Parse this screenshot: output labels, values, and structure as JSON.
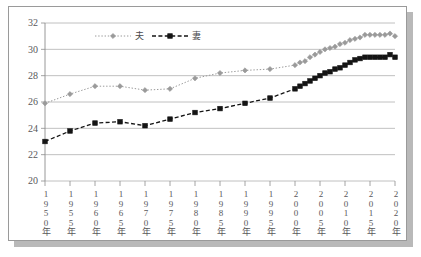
{
  "chart_data": {
    "type": "line",
    "title": "",
    "xlabel": "",
    "ylabel": "",
    "ylim": [
      20,
      32
    ],
    "yticks": [
      20,
      22,
      24,
      26,
      28,
      30,
      32
    ],
    "grid": true,
    "legend_position": "top-center-inside",
    "xlim": [
      1950,
      2020
    ],
    "xtick_labels": [
      "1950年",
      "1955年",
      "1960年",
      "1965年",
      "1970年",
      "1975年",
      "1980年",
      "1985年",
      "1990年",
      "1995年",
      "2000年",
      "2005年",
      "2010年",
      "2015年",
      "2020年"
    ],
    "x": [
      1950,
      1955,
      1960,
      1965,
      1970,
      1975,
      1980,
      1985,
      1990,
      1995,
      2000,
      2001,
      2002,
      2003,
      2004,
      2005,
      2006,
      2007,
      2008,
      2009,
      2010,
      2011,
      2012,
      2013,
      2014,
      2015,
      2016,
      2017,
      2018,
      2019,
      2020
    ],
    "series": [
      {
        "name": "夫",
        "color": "#9a9a9a",
        "linestyle": "dotted",
        "marker": "diamond",
        "values": [
          25.9,
          26.6,
          27.2,
          27.2,
          26.9,
          27.0,
          27.8,
          28.2,
          28.4,
          28.5,
          28.8,
          29.0,
          29.1,
          29.4,
          29.6,
          29.8,
          30.0,
          30.1,
          30.2,
          30.4,
          30.5,
          30.7,
          30.8,
          30.9,
          31.1,
          31.1,
          31.1,
          31.1,
          31.1,
          31.2,
          31.0
        ]
      },
      {
        "name": "妻",
        "color": "#141414",
        "linestyle": "dashed",
        "marker": "square",
        "values": [
          23.0,
          23.8,
          24.4,
          24.5,
          24.2,
          24.7,
          25.2,
          25.5,
          25.9,
          26.3,
          27.0,
          27.2,
          27.4,
          27.6,
          27.8,
          28.0,
          28.2,
          28.3,
          28.5,
          28.6,
          28.8,
          29.0,
          29.2,
          29.3,
          29.4,
          29.4,
          29.4,
          29.4,
          29.4,
          29.6,
          29.4
        ]
      }
    ],
    "legend": [
      {
        "label": "夫",
        "color": "#9a9a9a",
        "marker": "diamond",
        "linestyle": "dotted"
      },
      {
        "label": "妻",
        "color": "#141414",
        "marker": "square",
        "linestyle": "dashed"
      }
    ]
  },
  "axis": {
    "ytick_labels": [
      "32",
      "30",
      "28",
      "26",
      "24",
      "22",
      "20"
    ]
  },
  "xticks": [
    {
      "digits": [
        "1",
        "9",
        "5",
        "0"
      ],
      "unit": "年"
    },
    {
      "digits": [
        "1",
        "9",
        "5",
        "5"
      ],
      "unit": "年"
    },
    {
      "digits": [
        "1",
        "9",
        "6",
        "0"
      ],
      "unit": "年"
    },
    {
      "digits": [
        "1",
        "9",
        "6",
        "5"
      ],
      "unit": "年"
    },
    {
      "digits": [
        "1",
        "9",
        "7",
        "0"
      ],
      "unit": "年"
    },
    {
      "digits": [
        "1",
        "9",
        "7",
        "5"
      ],
      "unit": "年"
    },
    {
      "digits": [
        "1",
        "9",
        "8",
        "0"
      ],
      "unit": "年"
    },
    {
      "digits": [
        "1",
        "9",
        "8",
        "5"
      ],
      "unit": "年"
    },
    {
      "digits": [
        "1",
        "9",
        "9",
        "0"
      ],
      "unit": "年"
    },
    {
      "digits": [
        "1",
        "9",
        "9",
        "5"
      ],
      "unit": "年"
    },
    {
      "digits": [
        "2",
        "0",
        "0",
        "0"
      ],
      "unit": "年"
    },
    {
      "digits": [
        "2",
        "0",
        "0",
        "5"
      ],
      "unit": "年"
    },
    {
      "digits": [
        "2",
        "0",
        "1",
        "0"
      ],
      "unit": "年"
    },
    {
      "digits": [
        "2",
        "0",
        "1",
        "5"
      ],
      "unit": "年"
    },
    {
      "digits": [
        "2",
        "0",
        "2",
        "0"
      ],
      "unit": "年"
    }
  ],
  "colors": {
    "grid": "#b0b0b0",
    "axis": "#8d8d8d",
    "husband": "#9a9a9a",
    "wife": "#141414",
    "frame_border": "#9a9a9a",
    "shadow": "#b9b9b9",
    "background": "#ffffff"
  }
}
